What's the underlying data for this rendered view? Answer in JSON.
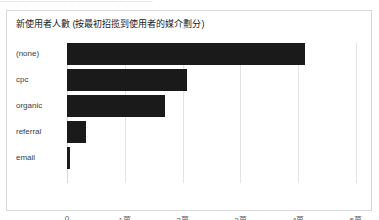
{
  "top_clip": {
    "text": "——————————————————"
  },
  "card": {
    "title": "新使用者人數 (按最初招揽到使用者的媒介劃分)"
  },
  "colors": {
    "bar": "#1a1a1a",
    "gridline": "#e3e3e3",
    "card_border": "#d8d8d8",
    "title_text": "#202124",
    "tick_text": "#5f6368"
  },
  "chart_data": {
    "type": "bar",
    "orientation": "horizontal",
    "title": "新使用者人數 (按最初招揽到使用者的媒介劃分)",
    "xlabel": "",
    "ylabel": "",
    "categories": [
      "(none)",
      "cpc",
      "organic",
      "referral",
      "email"
    ],
    "values": [
      41200,
      20700,
      17000,
      3300,
      500
    ],
    "xlim": [
      0,
      50000
    ],
    "xticks": [
      0,
      10000,
      20000,
      30000,
      40000,
      50000
    ],
    "xticklabels": [
      "0",
      "1萬",
      "2萬",
      "3萬",
      "4萬",
      "5萬"
    ],
    "grid": true,
    "legend": false,
    "series_color": "#1a1a1a"
  }
}
